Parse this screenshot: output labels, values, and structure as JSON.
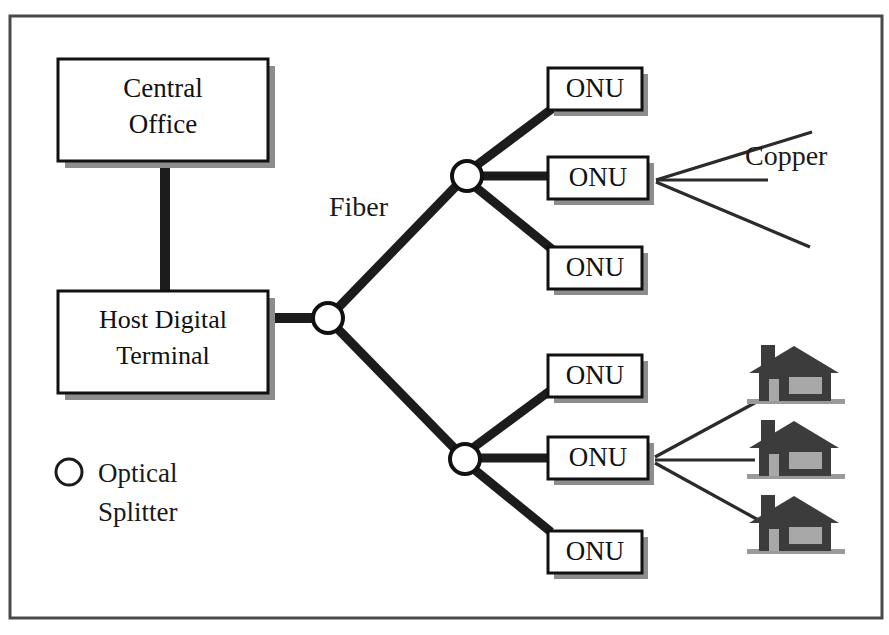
{
  "figure": {
    "title_fragment": "",
    "frame": {
      "x": 10,
      "y": 16,
      "width": 869,
      "height": 602
    }
  },
  "nodes": {
    "central_office": {
      "label_line1": "Central",
      "label_line2": "Office"
    },
    "host_digital_terminal": {
      "label_line1": "Host Digital",
      "label_line2": "Terminal"
    },
    "onu_label": "ONU"
  },
  "annotations": {
    "fiber": "Fiber",
    "copper": "Copper"
  },
  "legend": {
    "splitter_icon": "optical-splitter-circle-icon",
    "label_line1": "Optical",
    "label_line2": "Splitter"
  },
  "onus": {
    "top_branch": [
      "ONU",
      "ONU",
      "ONU"
    ],
    "bottom_branch": [
      "ONU",
      "ONU",
      "ONU"
    ]
  },
  "splitters": {
    "count": 3,
    "names": [
      "main-splitter",
      "upper-splitter",
      "lower-splitter"
    ]
  },
  "houses": {
    "count": 3,
    "icon": "house-icon"
  },
  "colors": {
    "line": "#1c1c1c",
    "copper": "#2b2b2b",
    "box_fill": "#ffffff",
    "box_stroke": "#111111",
    "shadow": "#8d8d8d",
    "house_body": "#3c3c3c",
    "house_glass": "#a8a8a8",
    "frame": "#4a4a4a",
    "background": "#ffffff"
  }
}
